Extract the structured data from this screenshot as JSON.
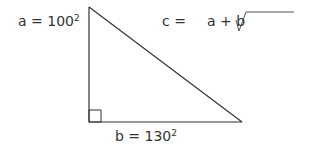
{
  "diagram": {
    "type": "right-triangle",
    "labels": {
      "a": {
        "name": "a",
        "eq": "=",
        "value": "100",
        "exponent": "2"
      },
      "b": {
        "name": "b",
        "eq": "=",
        "value": "130",
        "exponent": "2"
      },
      "c": {
        "lhs": "c =",
        "expr": "a + b"
      }
    },
    "colors": {
      "stroke": "#333333",
      "text": "#333333",
      "background": "#ffffff"
    },
    "vertices": {
      "top": [
        89,
        7
      ],
      "right_angle": [
        89,
        122
      ],
      "right": [
        242,
        122
      ]
    },
    "right_angle_marker_size": 12,
    "radical": {
      "tick_start": [
        236,
        20
      ],
      "bottom": [
        239,
        31
      ],
      "top": [
        246,
        12
      ],
      "overline_end": [
        294,
        12
      ]
    }
  }
}
